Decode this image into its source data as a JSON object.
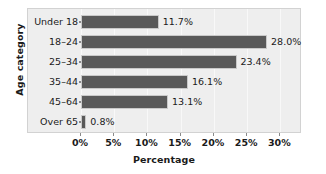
{
  "chart_data": {
    "type": "bar",
    "orientation": "horizontal",
    "title": "",
    "xlabel": "Percentage",
    "ylabel": "Age category",
    "categories": [
      "Under 18",
      "18–24",
      "25–34",
      "35–44",
      "45–64",
      "Over 65"
    ],
    "values": [
      11.7,
      28.0,
      23.4,
      16.1,
      13.1,
      0.8
    ],
    "data_labels": [
      "11.7%",
      "28.0%",
      "23.4%",
      "16.1%",
      "13.1%",
      "0.8%"
    ],
    "xlim": [
      0,
      32.5
    ],
    "xticks": [
      0,
      5,
      10,
      15,
      20,
      25,
      30
    ],
    "xtick_labels": [
      "0%",
      "5%",
      "10%",
      "15%",
      "20%",
      "25%",
      "30%"
    ],
    "grid": true,
    "legend": false,
    "bar_color": "#595959",
    "bar_border_color": "#c9c9c9",
    "panel_color": "#eeeeee",
    "panel_border_color": "#d2d2d2",
    "background_color": "#ffffff",
    "text_color": "#1a1a1a"
  }
}
